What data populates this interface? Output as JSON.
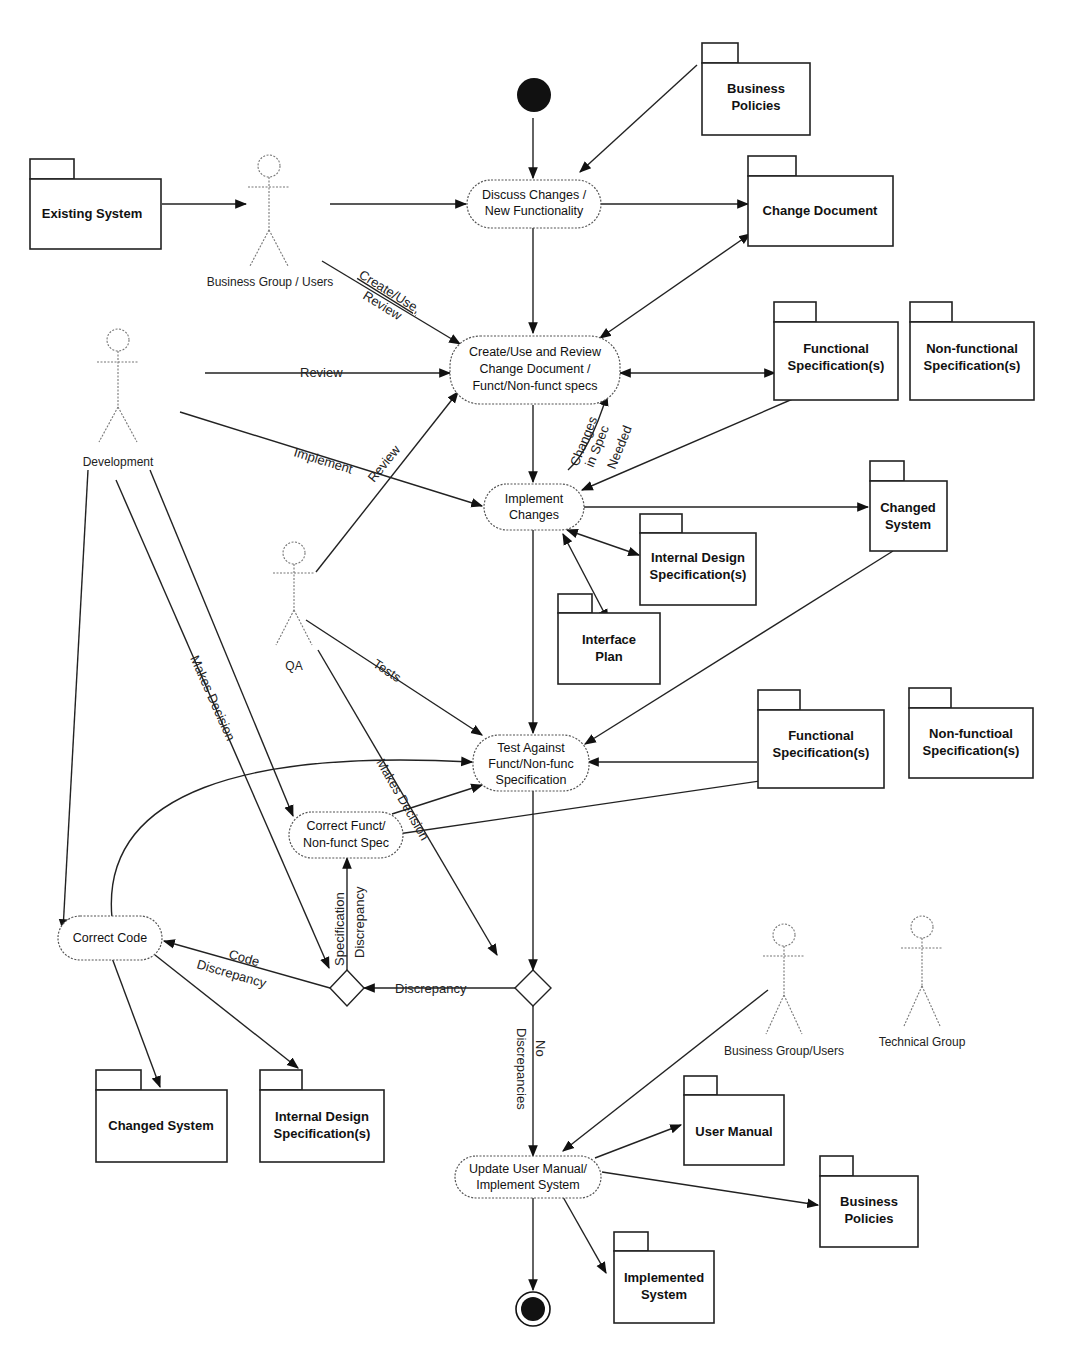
{
  "diagram": {
    "type": "UML activity diagram",
    "activities": {
      "discuss": [
        "Discuss Changes /",
        "New Functionality"
      ],
      "create_review": [
        "Create/Use and Review",
        "Change Document /",
        "Funct/Non-funct specs"
      ],
      "implement": [
        "Implement",
        "Changes"
      ],
      "test": [
        "Test Against",
        "Funct/Non-func",
        "Specification"
      ],
      "correct_spec": [
        "Correct Funct/",
        "Non-funct Spec"
      ],
      "correct_code": [
        "Correct Code"
      ],
      "update": [
        "Update User Manual/",
        "Implement System"
      ]
    },
    "packages": {
      "business_policies_top": [
        "Business",
        "Policies"
      ],
      "existing_system": [
        "Existing System"
      ],
      "change_document": [
        "Change Document"
      ],
      "functional_spec_1": [
        "Functional",
        "Specification(s)"
      ],
      "nonfunctional_spec_1": [
        "Non-functional",
        "Specification(s)"
      ],
      "changed_system_1": [
        "Changed",
        "System"
      ],
      "internal_design_1": [
        "Internal Design",
        "Specification(s)"
      ],
      "interface_plan": [
        "Interface",
        "Plan"
      ],
      "functional_spec_2": [
        "Functional",
        "Specification(s)"
      ],
      "nonfunctional_spec_2": [
        "Non-functioal",
        "Specification(s)"
      ],
      "changed_system_2": [
        "Changed System"
      ],
      "internal_design_2": [
        "Internal Design",
        "Specification(s)"
      ],
      "user_manual": [
        "User Manual"
      ],
      "business_policies_bottom": [
        "Business",
        "Policies"
      ],
      "implemented_system": [
        "Implemented",
        "System"
      ]
    },
    "actors": {
      "business_users_top": "Business Group / Users",
      "development": "Development",
      "qa": "QA",
      "business_users_bottom": "Business Group/Users",
      "technical_group": "Technical Group"
    },
    "edge_labels": {
      "create_use": "Create/Use,",
      "review_sub": "Review",
      "review_dev": "Review",
      "implement": "Implement",
      "review_qa": "Review",
      "changes_in_spec": [
        "Changes",
        "in Spec",
        "Needed"
      ],
      "tests": "Tests",
      "makes_decision_dev": "Makes Decision",
      "makes_decision_qa": "Makes Decision",
      "spec_discrepancy": [
        "Specification",
        "Discrepancy"
      ],
      "code_discrepancy": [
        "Code",
        "Discrepancy"
      ],
      "discrepancy": "Discrepancy",
      "no_discrepancies": [
        "No",
        "Discrepancies"
      ]
    }
  }
}
